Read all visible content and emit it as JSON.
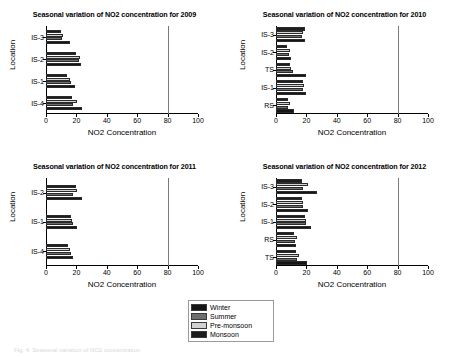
{
  "figure": {
    "caption": "Fig. 4. Seasonal variation of NO2 concentration"
  },
  "legend": {
    "position": "bottom-center",
    "items": [
      {
        "label": "Winter",
        "color": "#151515"
      },
      {
        "label": "Summer",
        "color": "#6e6e6e"
      },
      {
        "label": "Pre-monsoon",
        "color": "#d2d2d2"
      },
      {
        "label": "Monsoon",
        "color": "#1d1d1d"
      }
    ]
  },
  "axis": {
    "xlabel": "NO2 Concentration",
    "ylabel": "Location",
    "xticks": [
      0,
      20,
      40,
      60,
      80,
      100
    ],
    "xlim": [
      0,
      100
    ],
    "reference_line": 80,
    "grid": false
  },
  "chart_data": [
    {
      "type": "bar",
      "orientation": "horizontal",
      "title": "Seasonal variation of NO2 concentration for 2009",
      "xlabel": "NO2 Concentration",
      "ylabel": "Location",
      "xlim": [
        0,
        100
      ],
      "xticks": [
        0,
        20,
        40,
        60,
        80,
        100
      ],
      "grid": false,
      "categories": [
        "IS-3",
        "IS-2",
        "IS-1",
        "IS-4"
      ],
      "series": [
        {
          "name": "Winter",
          "values": [
            15.5,
            23.0,
            19.0,
            24.0
          ]
        },
        {
          "name": "Summer",
          "values": [
            10.5,
            21.5,
            16.5,
            18.0
          ]
        },
        {
          "name": "Pre-monsoon",
          "values": [
            11.5,
            22.5,
            15.5,
            20.5
          ]
        },
        {
          "name": "Monsoon",
          "values": [
            10.0,
            20.0,
            14.0,
            17.0
          ]
        }
      ]
    },
    {
      "type": "bar",
      "orientation": "horizontal",
      "title": "Seasonal variation of NO2 concentration for 2010",
      "xlabel": "NO2 Concentration",
      "ylabel": "Location",
      "xlim": [
        0,
        100
      ],
      "xticks": [
        0,
        20,
        40,
        60,
        80,
        100
      ],
      "grid": false,
      "categories": [
        "IS-3",
        "IS-2",
        "TS",
        "IS-1",
        "RS"
      ],
      "series": [
        {
          "name": "Winter",
          "values": [
            19.0,
            10.0,
            20.0,
            20.0,
            12.0
          ]
        },
        {
          "name": "Summer",
          "values": [
            17.0,
            8.5,
            11.5,
            18.0,
            8.0
          ]
        },
        {
          "name": "Pre-monsoon",
          "values": [
            18.0,
            9.0,
            10.0,
            18.5,
            9.0
          ]
        },
        {
          "name": "Monsoon",
          "values": [
            19.0,
            7.0,
            9.5,
            17.5,
            8.0
          ]
        }
      ]
    },
    {
      "type": "bar",
      "orientation": "horizontal",
      "title": "Seasonal variation of NO2 concentration for 2011",
      "xlabel": "NO2 Concentration",
      "ylabel": "Location",
      "xlim": [
        0,
        100
      ],
      "xticks": [
        0,
        20,
        40,
        60,
        80,
        100
      ],
      "grid": false,
      "categories": [
        "IS-2",
        "IS-1",
        "IS-4"
      ],
      "series": [
        {
          "name": "Winter",
          "values": [
            23.5,
            20.5,
            17.5
          ]
        },
        {
          "name": "Summer",
          "values": [
            18.0,
            17.5,
            16.5
          ]
        },
        {
          "name": "Pre-monsoon",
          "values": [
            20.5,
            17.0,
            15.5
          ]
        },
        {
          "name": "Monsoon",
          "values": [
            19.5,
            16.5,
            14.5
          ]
        }
      ]
    },
    {
      "type": "bar",
      "orientation": "horizontal",
      "title": "Seasonal variation of NO2 concentration for 2012",
      "xlabel": "NO2 Concentration",
      "ylabel": "Location",
      "xlim": [
        0,
        100
      ],
      "xticks": [
        0,
        20,
        40,
        60,
        80,
        100
      ],
      "grid": false,
      "categories": [
        "IS-3",
        "IS-2",
        "IS-1",
        "RS",
        "TS"
      ],
      "series": [
        {
          "name": "Winter",
          "values": [
            27.0,
            21.0,
            23.0,
            13.0,
            20.5
          ]
        },
        {
          "name": "Summer",
          "values": [
            18.0,
            17.5,
            19.5,
            12.5,
            14.0
          ]
        },
        {
          "name": "Pre-monsoon",
          "values": [
            21.0,
            18.0,
            20.0,
            14.0,
            15.0
          ]
        },
        {
          "name": "Monsoon",
          "values": [
            17.0,
            17.0,
            19.0,
            12.0,
            13.0
          ]
        }
      ]
    }
  ]
}
